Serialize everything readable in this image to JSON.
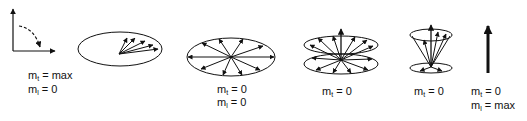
{
  "diagram": {
    "stroke_color": "#111111",
    "background": "#ffffff",
    "panels": [
      {
        "id": "axes",
        "shape": "coordinate-axes-with-rotation-arrow",
        "labels": [
          {
            "symbol": "m",
            "sub": "t",
            "rest": " = max"
          },
          {
            "symbol": "m",
            "sub": "l",
            "rest": " = 0"
          }
        ]
      },
      {
        "id": "dephasing-start",
        "shape": "ellipse-fan-of-vectors",
        "labels": []
      },
      {
        "id": "fully-dephased",
        "shape": "ellipse-radial-vectors",
        "labels": [
          {
            "symbol": "m",
            "sub": "t",
            "rest": " = 0"
          },
          {
            "symbol": "m",
            "sub": "l",
            "rest": " = 0"
          }
        ]
      },
      {
        "id": "double-cone",
        "shape": "two-ellipses-radial-vectors-with-vertical",
        "labels": [
          {
            "symbol": "m",
            "sub": "t",
            "rest": " = 0"
          }
        ]
      },
      {
        "id": "narrow-cone",
        "shape": "cone-of-vectors",
        "labels": [
          {
            "symbol": "m",
            "sub": "t",
            "rest": " = 0"
          }
        ]
      },
      {
        "id": "longitudinal",
        "shape": "single-vertical-arrow",
        "labels": [
          {
            "symbol": "m",
            "sub": "t",
            "rest": " = 0"
          },
          {
            "symbol": "m",
            "sub": "l",
            "rest": " = max"
          }
        ]
      }
    ]
  }
}
